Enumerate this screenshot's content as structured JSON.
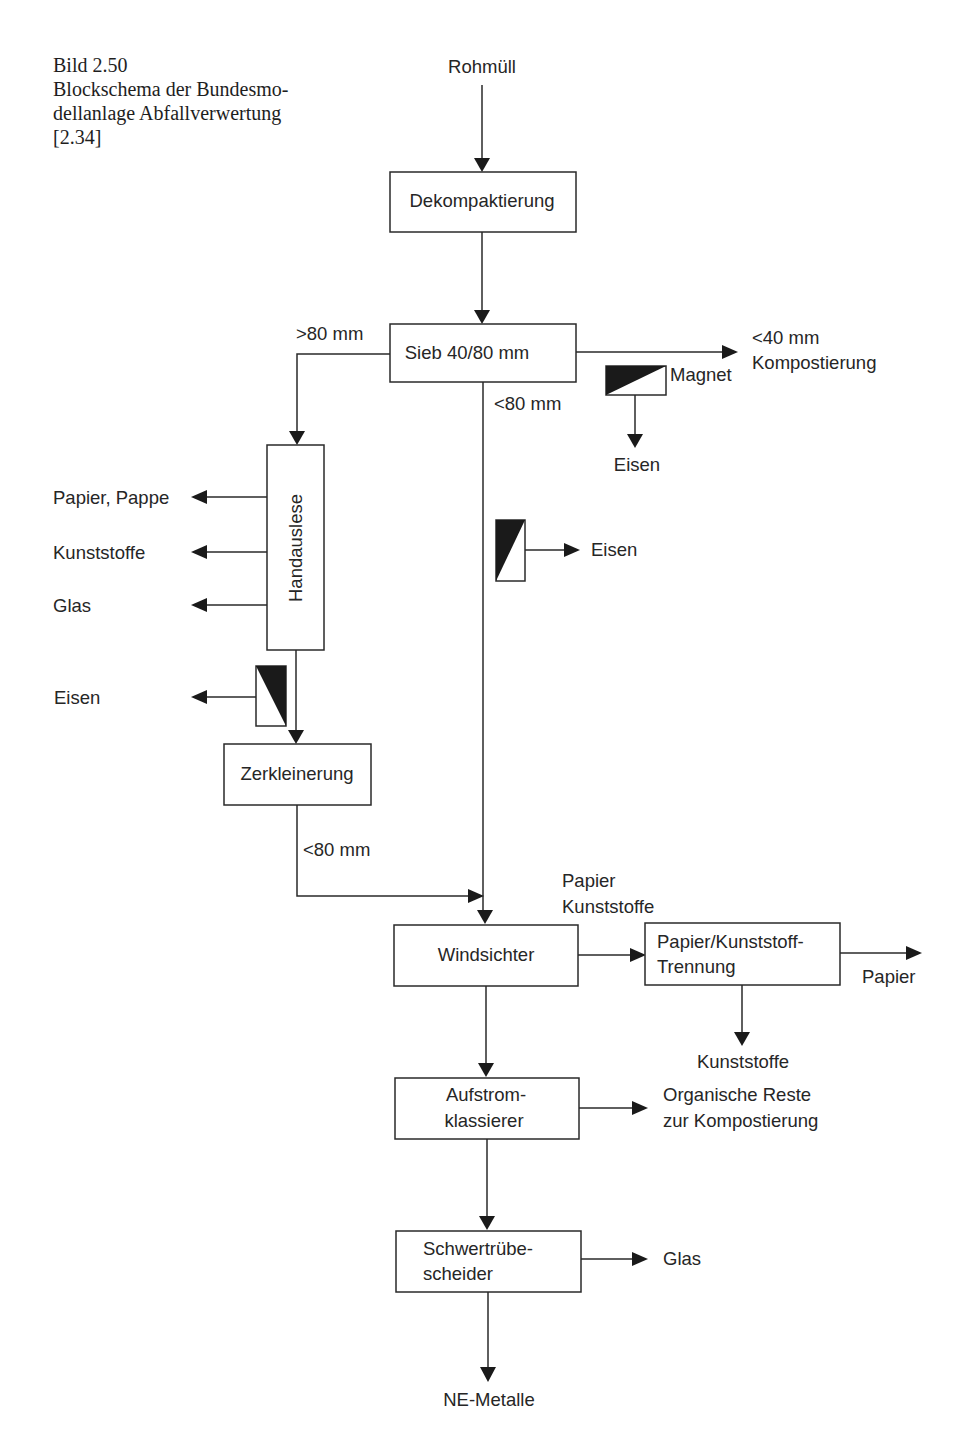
{
  "caption": {
    "figure": "Bild 2.50",
    "line1": "Blockschema der Bundesmo-",
    "line2": "dellanlage Abfallverwertung",
    "ref": "[2.34]"
  },
  "nodes": {
    "input": "Rohmüll",
    "dekompaktierung": "Dekompaktierung",
    "sieb": "Sieb 40/80 mm",
    "handauslese": "Handauslese",
    "zerkleinerung": "Zerkleinerung",
    "windsichter": "Windsichter",
    "trennung_l1": "Papier/Kunststoff-",
    "trennung_l2": "Trennung",
    "aufstrom_l1": "Aufstrom-",
    "aufstrom_l2": "klassierer",
    "schwer_l1": "Schwertrübe-",
    "schwer_l2": "scheider"
  },
  "labels": {
    "gt80": ">80 mm",
    "lt80_sieb": "<80 mm",
    "lt40": "<40 mm",
    "kompostierung": "Kompostierung",
    "magnet": "Magnet",
    "eisen_magnet": "Eisen",
    "eisen_mid": "Eisen",
    "papier_pappe": "Papier, Pappe",
    "kunststoffe_hand": "Kunststoffe",
    "glas_hand": "Glas",
    "eisen_left": "Eisen",
    "lt80_zerk": "<80 mm",
    "wind_out_l1": "Papier",
    "wind_out_l2": "Kunststoffe",
    "papier_out": "Papier",
    "kunststoffe_out": "Kunststoffe",
    "organisch_l1": "Organische Reste",
    "organisch_l2": "zur Kompostierung",
    "glas_out": "Glas",
    "ne_metalle": "NE-Metalle"
  }
}
